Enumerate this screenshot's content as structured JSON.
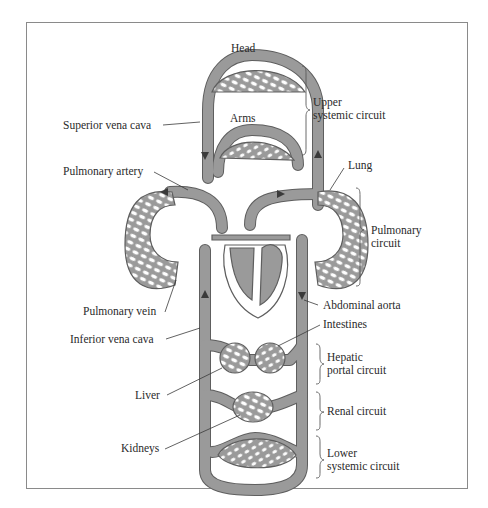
{
  "diagram": {
    "title": "",
    "type": "circulatory-system-schematic",
    "colors": {
      "vessel_fill": "#9a9a9a",
      "vessel_outline": "#5e5e5e",
      "capillary_holes": "#ffffff",
      "background": "#ffffff",
      "frame_border": "#8a8a8a",
      "text": "#2a2a2a"
    },
    "organ_labels": {
      "head": "Head",
      "arms": "Arms",
      "lung": "Lung",
      "intestines": "Intestines",
      "liver": "Liver",
      "kidneys": "Kidneys"
    },
    "vessel_labels": {
      "superior_vena_cava": "Superior vena cava",
      "pulmonary_artery": "Pulmonary artery",
      "pulmonary_vein": "Pulmonary vein",
      "inferior_vena_cava": "Inferior vena cava",
      "abdominal_aorta": "Abdominal aorta"
    },
    "circuits": [
      {
        "line1": "Upper",
        "line2": "systemic circuit"
      },
      {
        "line1": "Pulmonary",
        "line2": "circuit"
      },
      {
        "line1": "Hepatic",
        "line2": "portal circuit"
      },
      {
        "line1": "Renal circuit",
        "line2": ""
      },
      {
        "line1": "Lower",
        "line2": "systemic circuit"
      }
    ]
  }
}
